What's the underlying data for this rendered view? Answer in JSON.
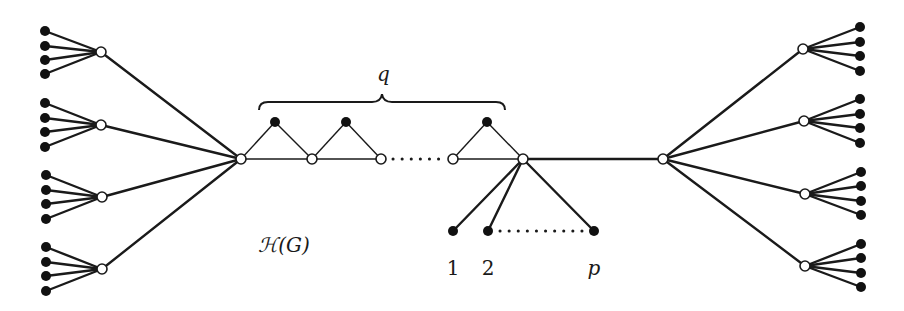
{
  "figure": {
    "type": "graph-diagram",
    "labels": {
      "brace_label": "q",
      "graph_name": "ℋ(G)",
      "pendant_1": "1",
      "pendant_2": "2",
      "pendant_p": "p"
    },
    "colors": {
      "edge": "#1a1a1a",
      "filled_vertex": "#111111",
      "open_vertex_fill": "#ffffff",
      "background": "#ffffff"
    },
    "structure": {
      "left_hub": {
        "x": 241,
        "y": 159,
        "type": "open"
      },
      "right_hub": {
        "x": 663,
        "y": 159,
        "type": "open"
      },
      "left_branches": [
        {
          "node": [
            101,
            52
          ],
          "leaves_y": [
            31,
            46,
            60,
            74
          ]
        },
        {
          "node": [
            101,
            125
          ],
          "leaves_y": [
            103,
            118,
            132,
            147
          ]
        },
        {
          "node": [
            102,
            197
          ],
          "leaves_y": [
            175,
            190,
            204,
            219
          ]
        },
        {
          "node": [
            102,
            269
          ],
          "leaves_y": [
            247,
            262,
            276,
            291
          ]
        }
      ],
      "right_branches": [
        {
          "node": [
            803,
            49
          ],
          "leaves_y": [
            27,
            42,
            56,
            71
          ]
        },
        {
          "node": [
            804,
            121
          ],
          "leaves_y": [
            99,
            114,
            128,
            143
          ]
        },
        {
          "node": [
            805,
            194
          ],
          "leaves_y": [
            172,
            186,
            201,
            215
          ]
        },
        {
          "node": [
            805,
            266
          ],
          "leaves_y": [
            244,
            258,
            273,
            287
          ]
        }
      ],
      "chain_open_vertices": [
        [
          241,
          159
        ],
        [
          312,
          159
        ],
        [
          381,
          159
        ],
        [
          453,
          159
        ],
        [
          523,
          159
        ]
      ],
      "chain_triangle_tops": [
        [
          275,
          122
        ],
        [
          346,
          122
        ],
        [
          487,
          122
        ]
      ],
      "pendant_vertices": [
        [
          453,
          231
        ],
        [
          488,
          231
        ],
        [
          594,
          231
        ]
      ],
      "triangle_count_label": "q",
      "pendant_count_label": "p"
    }
  }
}
